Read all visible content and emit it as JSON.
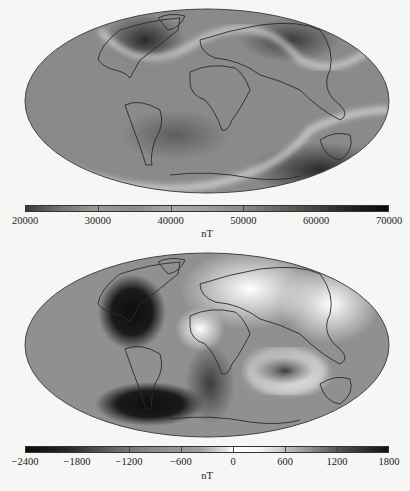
{
  "figure": {
    "panels": [
      {
        "id": "total-intensity",
        "colorbar": {
          "unit": "nT",
          "ticks": [
            "20000",
            "30000",
            "40000",
            "50000",
            "60000",
            "70000"
          ],
          "range": [
            20000,
            70000
          ]
        }
      },
      {
        "id": "secular-change",
        "colorbar": {
          "unit": "nT",
          "ticks": [
            "-2400",
            "-1800",
            "-1200",
            "-600",
            "0",
            "600",
            "1200",
            "1800"
          ],
          "range": [
            -2400,
            1800
          ]
        }
      }
    ]
  },
  "colors": {
    "background": "#f6f6f4",
    "map_mid": "#8c8c8c",
    "map_dark": "#2a2a2a",
    "map_light": "#ededed",
    "coast": "#2b2b2b"
  }
}
